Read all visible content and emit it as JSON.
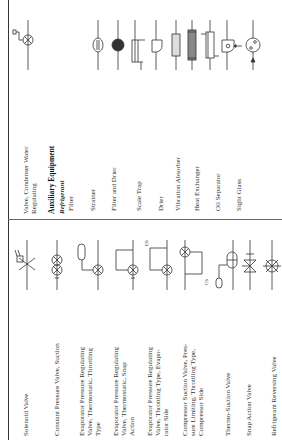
{
  "header": {
    "title_fragment": "(Continued)"
  },
  "left_column": {
    "items": [
      {
        "label": "Solenoid Valve",
        "symbol": "solenoid-valve-symbol"
      },
      {
        "label": "Constant Pressure Valve, Suction",
        "symbol": "constant-pressure-valve-symbol"
      },
      {
        "label": "Evaporator Pressure Regulating\n   Valve, Thermostatic, Throttling\n   Type",
        "symbol": "epr-thermostatic-throttling-symbol"
      },
      {
        "label": "Evaporator Pressure Regulating\n   Valve, Thermostatic, Snap\n   Action",
        "symbol": "epr-thermostatic-snap-symbol"
      },
      {
        "label": "Evaporator Pressure Regulating\n   Valve, Throttling Type, Evapo-\n   rator Side",
        "symbol": "epr-throttling-evaporator-symbol",
        "tag": "ES"
      },
      {
        "label": "Compressor Suction Valve, Pres-\n   sure Limiting, Throttling Type,\n   Compressor Side",
        "symbol": "compressor-suction-valve-symbol",
        "tag": "CS"
      },
      {
        "label": "Thermo-Suction Valve",
        "symbol": "thermo-suction-valve-symbol"
      },
      {
        "label": "Snap Action Valve",
        "symbol": "snap-action-valve-symbol"
      },
      {
        "label": "Refrigerant Reversing Valve",
        "symbol": "reversing-valve-symbol"
      }
    ]
  },
  "right_column": {
    "items": [
      {
        "label": "Valve, Condenser Water\n   Regulating",
        "symbol": "condenser-water-valve-symbol"
      },
      {
        "label": "Auxiliary Equipment",
        "style": "heading"
      },
      {
        "label": "Refrigerant",
        "style": "subheading"
      },
      {
        "label": "Filter",
        "symbol": "filter-symbol"
      },
      {
        "label": "Strainer",
        "symbol": "strainer-symbol"
      },
      {
        "label": "Filter and Drier",
        "symbol": "filter-drier-symbol"
      },
      {
        "label": "Scale Trap",
        "symbol": "scale-trap-symbol"
      },
      {
        "label": "Drier",
        "symbol": "drier-symbol"
      },
      {
        "label": "Vibration Absorber",
        "symbol": "vibration-absorber-symbol"
      },
      {
        "label": "Heat Exchanger",
        "symbol": "heat-exchanger-symbol"
      },
      {
        "label": "Oil Separator",
        "symbol": "oil-separator-symbol"
      },
      {
        "label": "Sight Glass",
        "symbol": "sight-glass-symbol"
      }
    ]
  }
}
